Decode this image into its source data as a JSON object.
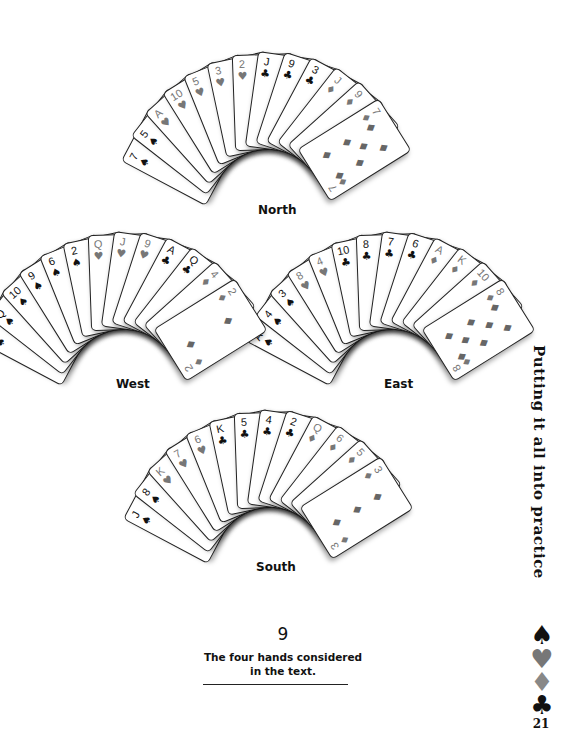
{
  "figure": {
    "number": "9",
    "caption": "The four hands considered in the text."
  },
  "sidebar": {
    "chapter_title": "Putting it all into practice",
    "suits": [
      {
        "name": "spade",
        "glyph": "♠",
        "color": "#111111"
      },
      {
        "name": "heart",
        "glyph": "♥",
        "color": "#777777"
      },
      {
        "name": "diamond",
        "glyph": "♦",
        "color": "#888888"
      },
      {
        "name": "club",
        "glyph": "♣",
        "color": "#111111"
      }
    ],
    "page_number": "21"
  },
  "hands": {
    "north": {
      "label": "North",
      "cards": [
        {
          "rank": "7",
          "suit": "♠"
        },
        {
          "rank": "5",
          "suit": "♠"
        },
        {
          "rank": "A",
          "suit": "♥"
        },
        {
          "rank": "10",
          "suit": "♥"
        },
        {
          "rank": "5",
          "suit": "♥"
        },
        {
          "rank": "3",
          "suit": "♥"
        },
        {
          "rank": "2",
          "suit": "♥"
        },
        {
          "rank": "J",
          "suit": "♣"
        },
        {
          "rank": "9",
          "suit": "♣"
        },
        {
          "rank": "3",
          "suit": "♣"
        },
        {
          "rank": "J",
          "suit": "♦"
        },
        {
          "rank": "9",
          "suit": "♦"
        },
        {
          "rank": "7",
          "suit": "♦"
        }
      ]
    },
    "west": {
      "label": "West",
      "cards": [
        {
          "rank": "K",
          "suit": "♠"
        },
        {
          "rank": "Q",
          "suit": "♠"
        },
        {
          "rank": "10",
          "suit": "♠"
        },
        {
          "rank": "9",
          "suit": "♠"
        },
        {
          "rank": "6",
          "suit": "♠"
        },
        {
          "rank": "2",
          "suit": "♠"
        },
        {
          "rank": "Q",
          "suit": "♥"
        },
        {
          "rank": "J",
          "suit": "♥"
        },
        {
          "rank": "9",
          "suit": "♥"
        },
        {
          "rank": "A",
          "suit": "♣"
        },
        {
          "rank": "Q",
          "suit": "♣"
        },
        {
          "rank": "4",
          "suit": "♦"
        },
        {
          "rank": "2",
          "suit": "♦"
        }
      ]
    },
    "east": {
      "label": "East",
      "cards": [
        {
          "rank": "A",
          "suit": "♠"
        },
        {
          "rank": "4",
          "suit": "♠"
        },
        {
          "rank": "3",
          "suit": "♠"
        },
        {
          "rank": "8",
          "suit": "♥"
        },
        {
          "rank": "4",
          "suit": "♥"
        },
        {
          "rank": "10",
          "suit": "♣"
        },
        {
          "rank": "8",
          "suit": "♣"
        },
        {
          "rank": "7",
          "suit": "♣"
        },
        {
          "rank": "6",
          "suit": "♣"
        },
        {
          "rank": "A",
          "suit": "♦"
        },
        {
          "rank": "K",
          "suit": "♦"
        },
        {
          "rank": "10",
          "suit": "♦"
        },
        {
          "rank": "8",
          "suit": "♦"
        }
      ]
    },
    "south": {
      "label": "South",
      "cards": [
        {
          "rank": "J",
          "suit": "♠"
        },
        {
          "rank": "8",
          "suit": "♠"
        },
        {
          "rank": "K",
          "suit": "♥"
        },
        {
          "rank": "7",
          "suit": "♥"
        },
        {
          "rank": "6",
          "suit": "♥"
        },
        {
          "rank": "K",
          "suit": "♣"
        },
        {
          "rank": "5",
          "suit": "♣"
        },
        {
          "rank": "4",
          "suit": "♣"
        },
        {
          "rank": "2",
          "suit": "♣"
        },
        {
          "rank": "Q",
          "suit": "♦"
        },
        {
          "rank": "6",
          "suit": "♦"
        },
        {
          "rank": "5",
          "suit": "♦"
        },
        {
          "rank": "3",
          "suit": "♦"
        }
      ]
    }
  }
}
